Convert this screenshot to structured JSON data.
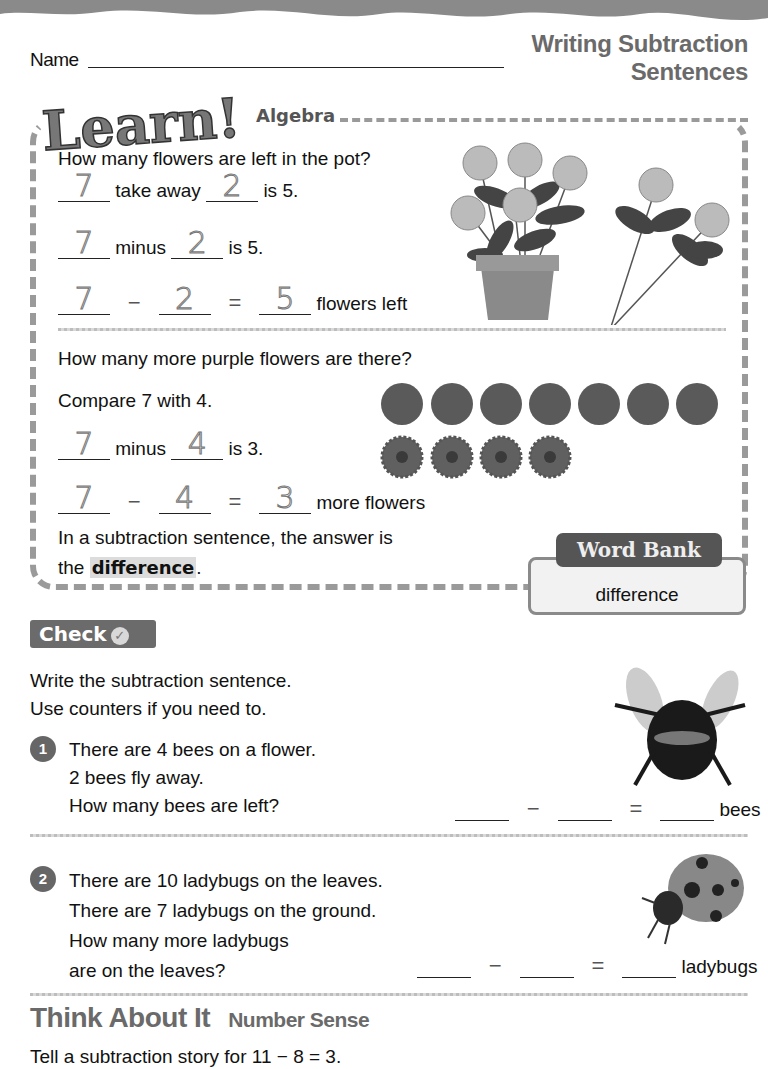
{
  "header": {
    "name_label": "Name",
    "title_line1": "Writing Subtraction",
    "title_line2": "Sentences"
  },
  "learn": {
    "logo_text": "Learn!",
    "subtitle": "Algebra",
    "q1": "How many flowers are left in the pot?",
    "row1": {
      "a": "7",
      "word": "take away",
      "b": "2",
      "tail": "is 5."
    },
    "row2": {
      "a": "7",
      "word": "minus",
      "b": "2",
      "tail": "is 5."
    },
    "row3": {
      "a": "7",
      "op": "−",
      "b": "2",
      "eq": "=",
      "c": "5",
      "tail": "flowers left"
    },
    "q2": "How many more purple flowers are there?",
    "compare": "Compare 7 with 4.",
    "row4": {
      "a": "7",
      "word": "minus",
      "b": "4",
      "tail": "is 3."
    },
    "row5": {
      "a": "7",
      "op": "−",
      "b": "4",
      "eq": "=",
      "c": "3",
      "tail": "more flowers"
    },
    "definition_1": "In a subtraction sentence, the answer is",
    "definition_2_pre": "the",
    "definition_term": "difference",
    "definition_2_post": ".",
    "purple_flower_count": 7,
    "orange_flower_count": 4,
    "pot_flower_count": 5,
    "loose_flower_count": 2
  },
  "word_bank": {
    "title": "Word Bank",
    "words": [
      "difference"
    ]
  },
  "check": {
    "label": "Check",
    "instruction_1": "Write the subtraction sentence.",
    "instruction_2": "Use counters if you need to.",
    "problems": [
      {
        "number": "1",
        "lines": [
          "There are 4 bees on a flower.",
          "2 bees fly away.",
          "How many bees are left?"
        ],
        "minus": "−",
        "equals": "=",
        "unit": "bees"
      },
      {
        "number": "2",
        "lines": [
          "There are 10 ladybugs on the leaves.",
          "There are 7 ladybugs on the ground.",
          "How many more ladybugs",
          "are on the leaves?"
        ],
        "minus": "−",
        "equals": "=",
        "unit": "ladybugs"
      }
    ]
  },
  "think": {
    "title": "Think About It",
    "subtitle": "Number Sense",
    "prompt": "Tell a subtraction story for 11 − 8 = 3."
  }
}
